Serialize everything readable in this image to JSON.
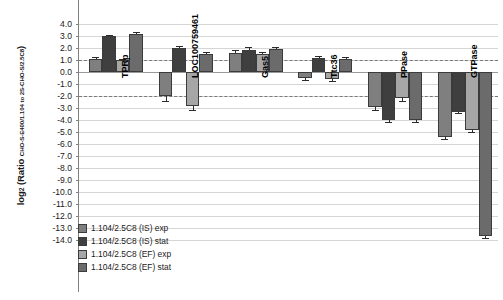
{
  "chart_data": {
    "type": "bar",
    "title": "",
    "subtitle": "",
    "xlabel": "",
    "ylabel": "log2 (Ratio CHO-S-E400/1.104 to 2S-CHO-S/2.5C8)",
    "ylabel_parts": {
      "main": "log",
      "main_sub": "2",
      "paren_open": " (Ratio ",
      "ratio_sub": "CHO-S-E400/1.104 to 2S-CHO-S/2.5C8",
      "paren_close": ")"
    },
    "ylim": [
      -14.0,
      4.0
    ],
    "ytick_step": 1.0,
    "yticks": [
      "4.0",
      "3.0",
      "2.0",
      "1.0",
      "0.0",
      "-1.0",
      "-2.0",
      "-3.0",
      "-4.0",
      "-5.0",
      "-6.0",
      "-7.0",
      "-8.0",
      "-9.0",
      "-10.0",
      "-11.0",
      "-12.0",
      "-13.0",
      "-14.0"
    ],
    "grid": true,
    "reference_lines": [
      1.0,
      -2.0
    ],
    "legend_position": "bottom-left",
    "categories": [
      "TPRp",
      "LOC100759461",
      "Gas5",
      "Ttc36",
      "PPase",
      "GTPase"
    ],
    "series": [
      {
        "name": "1.104/2.5C8 (IS) exp",
        "color": "#7f7f7f",
        "values": [
          1.1,
          -2.0,
          1.6,
          -0.5,
          -2.9,
          -5.4
        ],
        "errors": [
          0.15,
          0.45,
          0.25,
          0.15,
          0.3,
          0.2
        ]
      },
      {
        "name": "1.104/2.5C8 (IS) stat",
        "color": "#3f3f3f",
        "values": [
          3.0,
          2.0,
          1.8,
          1.2,
          -4.0,
          -3.3
        ],
        "errors": [
          0.1,
          0.2,
          0.3,
          0.15,
          0.2,
          0.15
        ]
      },
      {
        "name": "1.104/2.5C8 (EF) exp",
        "color": "#a6a6a6",
        "values": [
          1.0,
          -2.8,
          1.5,
          -0.6,
          -2.2,
          -4.8
        ],
        "errors": [
          0.12,
          0.4,
          0.2,
          0.12,
          0.25,
          0.2
        ]
      },
      {
        "name": "1.104/2.5C8 (EF) stat",
        "color": "#6b6b6b",
        "values": [
          3.2,
          1.5,
          1.9,
          1.1,
          -4.0,
          -13.7
        ],
        "errors": [
          0.1,
          0.2,
          0.2,
          0.15,
          0.2,
          0.15
        ]
      }
    ]
  },
  "legend": {
    "items": [
      {
        "label": "1.104/2.5C8 (IS) exp",
        "color": "#7f7f7f"
      },
      {
        "label": "1.104/2.5C8 (IS) stat",
        "color": "#3f3f3f"
      },
      {
        "label": "1.104/2.5C8 (EF) exp",
        "color": "#a6a6a6"
      },
      {
        "label": "1.104/2.5C8 (EF) stat",
        "color": "#6b6b6b"
      }
    ]
  }
}
